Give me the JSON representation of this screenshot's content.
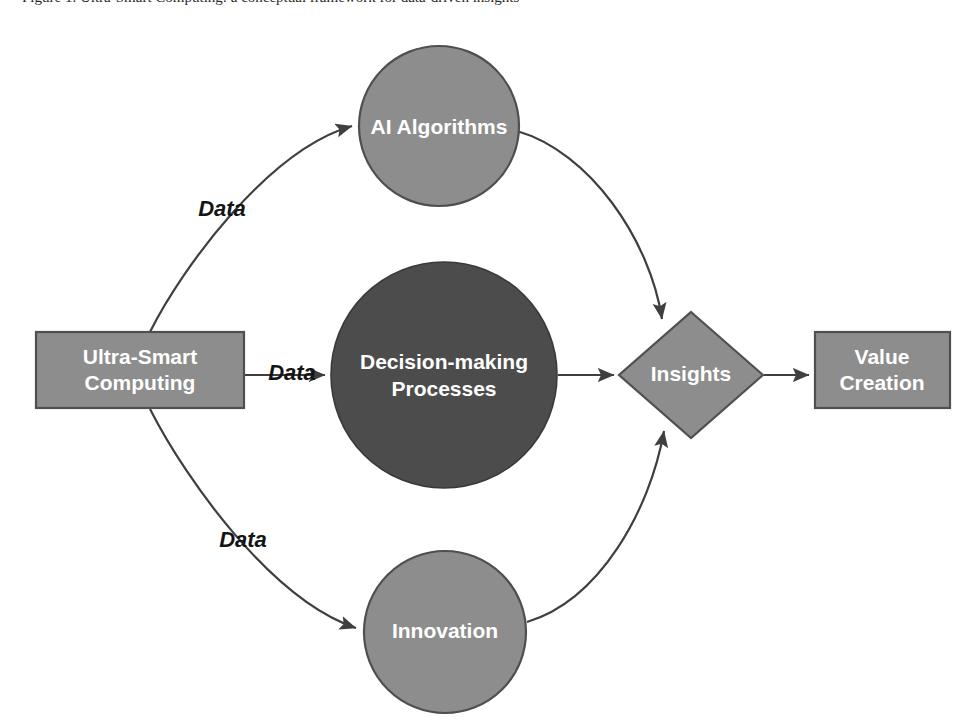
{
  "figure": {
    "caption_fragment": "Figure 1. Ultra-Smart Computing: a conceptual framework for data-driven insights",
    "background_color": "#ffffff"
  },
  "palette": {
    "node_light_fill": "#8d8d8d",
    "node_dark_fill": "#4c4c4c",
    "node_stroke": "#4f4f4f",
    "connector_stroke": "#3f3f3f",
    "node_text": "#ffffff",
    "edge_text": "#141414"
  },
  "nodes": [
    {
      "id": "ultra-smart-computing",
      "shape": "rectangle",
      "label_lines": [
        "Ultra-Smart",
        "Computing"
      ],
      "fill": "#8d8d8d",
      "x": 36,
      "y": 332,
      "width": 208,
      "height": 76
    },
    {
      "id": "ai-algorithms",
      "shape": "circle",
      "label_lines": [
        "AI Algorithms"
      ],
      "fill": "#8d8d8d",
      "cx": 439,
      "cy": 126,
      "r": 80
    },
    {
      "id": "decision-making-processes",
      "shape": "circle",
      "label_lines": [
        "Decision-making",
        "Processes"
      ],
      "fill": "#4c4c4c",
      "cx": 444,
      "cy": 375,
      "r": 113
    },
    {
      "id": "innovation",
      "shape": "circle",
      "label_lines": [
        "Innovation"
      ],
      "fill": "#8d8d8d",
      "cx": 445,
      "cy": 632,
      "r": 81
    },
    {
      "id": "insights",
      "shape": "diamond",
      "label_lines": [
        "Insights"
      ],
      "fill": "#8d8d8d",
      "cx": 691,
      "cy": 375,
      "rx": 72,
      "ry": 63
    },
    {
      "id": "value-creation",
      "shape": "rectangle",
      "label_lines": [
        "Value",
        "Creation"
      ],
      "fill": "#8d8d8d",
      "x": 815,
      "y": 332,
      "width": 135,
      "height": 76
    }
  ],
  "edges": [
    {
      "id": "edge-computing-to-ai",
      "from": "ultra-smart-computing",
      "to": "ai-algorithms",
      "label": "Data",
      "label_x": 222,
      "label_y": 210
    },
    {
      "id": "edge-computing-to-decision",
      "from": "ultra-smart-computing",
      "to": "decision-making-processes",
      "label": "Data",
      "label_x": 292,
      "label_y": 374
    },
    {
      "id": "edge-computing-to-innovation",
      "from": "ultra-smart-computing",
      "to": "innovation",
      "label": "Data",
      "label_x": 243,
      "label_y": 541
    },
    {
      "id": "edge-ai-to-insights",
      "from": "ai-algorithms",
      "to": "insights",
      "label": ""
    },
    {
      "id": "edge-decision-to-insights",
      "from": "decision-making-processes",
      "to": "insights",
      "label": ""
    },
    {
      "id": "edge-innovation-to-insights",
      "from": "innovation",
      "to": "insights",
      "label": ""
    },
    {
      "id": "edge-insights-to-value",
      "from": "insights",
      "to": "value-creation",
      "label": ""
    }
  ]
}
